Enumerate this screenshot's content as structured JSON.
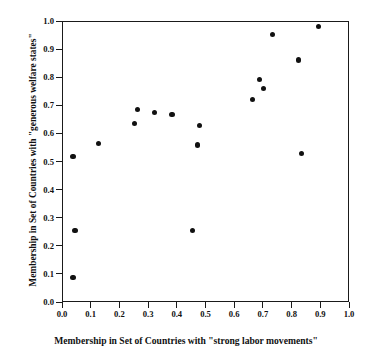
{
  "chart_data": {
    "type": "scatter",
    "title": "",
    "xlabel": "Membership in Set of Countries with \"strong labor movements\"",
    "ylabel": "Membership in Set of Countries with \"generous welfare states\"",
    "xlim": [
      0.0,
      1.0
    ],
    "ylim": [
      0.0,
      1.0
    ],
    "xticks": [
      "0.0",
      "0.1",
      "0.2",
      "0.3",
      "0.4",
      "0.5",
      "0.6",
      "0.7",
      "0.8",
      "0.9",
      "1.0"
    ],
    "yticks": [
      "0.0",
      "0.1",
      "0.2",
      "0.3",
      "0.4",
      "0.5",
      "0.6",
      "0.7",
      "0.8",
      "0.9",
      "1.0"
    ],
    "xtick_values": [
      0.0,
      0.1,
      0.2,
      0.3,
      0.4,
      0.5,
      0.6,
      0.7,
      0.8,
      0.9,
      1.0
    ],
    "ytick_values": [
      0.0,
      0.1,
      0.2,
      0.3,
      0.4,
      0.5,
      0.6,
      0.7,
      0.8,
      0.9,
      1.0
    ],
    "grid": false,
    "legend": null,
    "marker": "filled-circle",
    "marker_color": "#111111",
    "points": [
      {
        "x": 0.035,
        "y": 0.091
      },
      {
        "x": 0.035,
        "y": 0.522
      },
      {
        "x": 0.042,
        "y": 0.259
      },
      {
        "x": 0.125,
        "y": 0.569
      },
      {
        "x": 0.25,
        "y": 0.638
      },
      {
        "x": 0.26,
        "y": 0.69
      },
      {
        "x": 0.32,
        "y": 0.679
      },
      {
        "x": 0.38,
        "y": 0.672
      },
      {
        "x": 0.45,
        "y": 0.259
      },
      {
        "x": 0.47,
        "y": 0.562
      },
      {
        "x": 0.475,
        "y": 0.631
      },
      {
        "x": 0.66,
        "y": 0.723
      },
      {
        "x": 0.685,
        "y": 0.795
      },
      {
        "x": 0.7,
        "y": 0.763
      },
      {
        "x": 0.73,
        "y": 0.955
      },
      {
        "x": 0.82,
        "y": 0.865
      },
      {
        "x": 0.83,
        "y": 0.533
      },
      {
        "x": 0.89,
        "y": 0.985
      }
    ]
  }
}
